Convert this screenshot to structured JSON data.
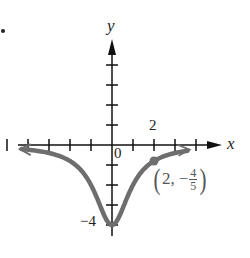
{
  "chart_data": {
    "type": "line",
    "title": "",
    "function": "y = -4/(x^2 + 1)",
    "xlabel": "x",
    "ylabel": "y",
    "xlim": [
      -5.5,
      4.5
    ],
    "ylim": [
      -4.5,
      5
    ],
    "x_ticks": [
      -5,
      -4,
      -3,
      -2,
      -1,
      1,
      2,
      3,
      4
    ],
    "y_ticks": [
      -4,
      -3,
      -2,
      -1,
      1,
      2,
      3,
      4
    ],
    "tick_labels": {
      "x": [
        {
          "value": 2,
          "label": "2"
        }
      ],
      "y": [
        {
          "value": -4,
          "label": "−4"
        }
      ],
      "origin": "0"
    },
    "grid": false,
    "series": [
      {
        "name": "curve",
        "color": "#666666",
        "x": [
          -5,
          -4,
          -3,
          -2,
          -1.5,
          -1,
          -0.5,
          0,
          0.5,
          1,
          1.5,
          2,
          3,
          4
        ],
        "y": [
          -0.154,
          -0.235,
          -0.4,
          -0.8,
          -1.231,
          -2,
          -3.2,
          -4,
          -3.2,
          -2,
          -1.231,
          -0.8,
          -0.4,
          -0.235
        ]
      }
    ],
    "annotations": [
      {
        "type": "point",
        "x": 2,
        "y": -0.8,
        "label": "(2, −4/5)"
      }
    ]
  },
  "labels": {
    "x_axis": "x",
    "y_axis": "y",
    "tick_2": "2",
    "origin": "0",
    "tick_neg4": "−4",
    "point_x": "2,",
    "point_minus": "−",
    "point_num": "4",
    "point_den": "5",
    "paren_open": "(",
    "paren_close": ")"
  },
  "colors": {
    "axis": "#111111",
    "curve": "#6e6e6e",
    "text": "#222222"
  }
}
